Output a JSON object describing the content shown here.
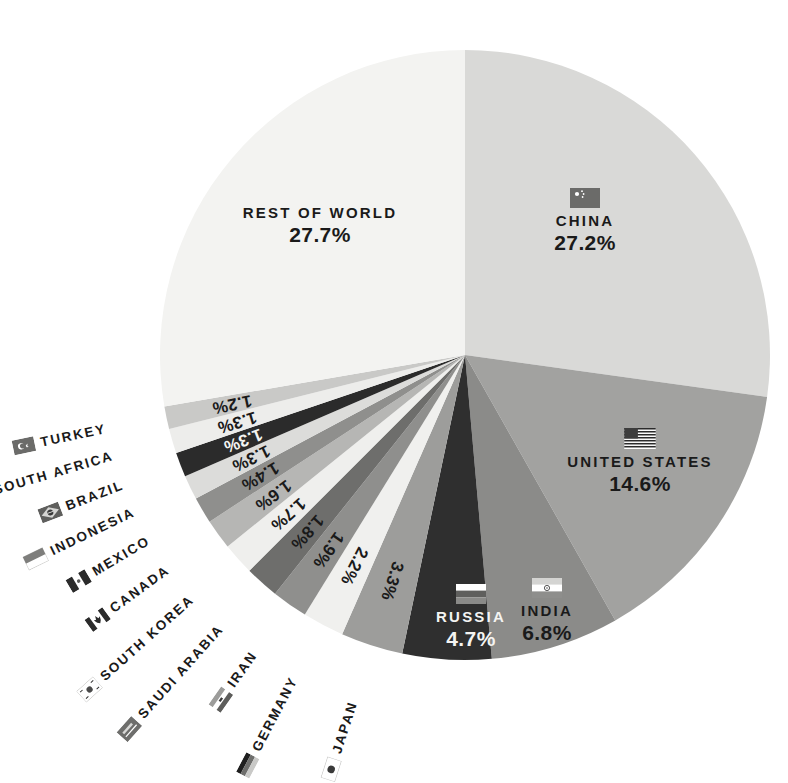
{
  "chart_data": {
    "type": "pie",
    "title": "",
    "subtitle": "",
    "xlabel": "",
    "ylabel": "",
    "legend_position": "on-slice",
    "grid": false,
    "unit": "%",
    "total": 100,
    "categories": [
      "China",
      "United States",
      "India",
      "Russia",
      "Japan",
      "Germany",
      "Iran",
      "Saudi Arabia",
      "South Korea",
      "Canada",
      "Mexico",
      "Indonesia",
      "Brazil",
      "South Africa",
      "Turkey",
      "Rest of World"
    ],
    "values": [
      27.2,
      14.6,
      6.8,
      4.7,
      3.3,
      2.2,
      1.9,
      1.8,
      1.7,
      1.6,
      1.4,
      1.3,
      1.3,
      1.3,
      1.2,
      27.7
    ],
    "slices": [
      {
        "name": "CHINA",
        "value": 27.2,
        "label": "27.2%",
        "color": "#d9d9d7",
        "label_placement": "inside",
        "flag": "flag-china",
        "text_color": "#1a1a1a"
      },
      {
        "name": "UNITED STATES",
        "value": 14.6,
        "label": "14.6%",
        "color": "#a2a2a0",
        "label_placement": "inside",
        "flag": "flag-united-states",
        "text_color": "#1a1a1a"
      },
      {
        "name": "INDIA",
        "value": 6.8,
        "label": "6.8%",
        "color": "#8b8b89",
        "label_placement": "inside",
        "flag": "flag-india",
        "text_color": "#1a1a1a"
      },
      {
        "name": "RUSSIA",
        "value": 4.7,
        "label": "4.7%",
        "color": "#2f2f2f",
        "label_placement": "inside",
        "flag": "flag-russia",
        "text_color": "#f4f4f2"
      },
      {
        "name": "JAPAN",
        "value": 3.3,
        "label": "3.3%",
        "color": "#9d9d9b",
        "label_placement": "outside",
        "flag": "flag-japan",
        "text_color": "#1a1a1a"
      },
      {
        "name": "GERMANY",
        "value": 2.2,
        "label": "2.2%",
        "color": "#f0f0ee",
        "label_placement": "outside",
        "flag": "flag-germany",
        "text_color": "#1a1a1a"
      },
      {
        "name": "IRAN",
        "value": 1.9,
        "label": "1.9%",
        "color": "#8f8f8d",
        "label_placement": "outside",
        "flag": "flag-iran",
        "text_color": "#1a1a1a"
      },
      {
        "name": "SAUDI ARABIA",
        "value": 1.8,
        "label": "1.8%",
        "color": "#6e6e6c",
        "label_placement": "outside",
        "flag": "flag-saudi-arabia",
        "text_color": "#1a1a1a"
      },
      {
        "name": "SOUTH KOREA",
        "value": 1.7,
        "label": "1.7%",
        "color": "#efefed",
        "label_placement": "outside",
        "flag": "flag-south-korea",
        "text_color": "#1a1a1a"
      },
      {
        "name": "CANADA",
        "value": 1.6,
        "label": "1.6%",
        "color": "#b6b6b4",
        "label_placement": "outside",
        "flag": "flag-canada",
        "text_color": "#1a1a1a"
      },
      {
        "name": "MEXICO",
        "value": 1.4,
        "label": "1.4%",
        "color": "#8f8f8d",
        "label_placement": "outside",
        "flag": "flag-mexico",
        "text_color": "#1a1a1a"
      },
      {
        "name": "INDONESIA",
        "value": 1.3,
        "label": "1.3%",
        "color": "#dcdcda",
        "label_placement": "outside",
        "flag": "flag-indonesia",
        "text_color": "#1a1a1a"
      },
      {
        "name": "BRAZIL",
        "value": 1.3,
        "label": "1.3%",
        "color": "#2b2b2b",
        "label_placement": "outside",
        "flag": "flag-brazil",
        "text_color": "#f4f4f2"
      },
      {
        "name": "SOUTH AFRICA",
        "value": 1.3,
        "label": "1.3%",
        "color": "#ededeb",
        "label_placement": "outside",
        "flag": "flag-south-africa",
        "text_color": "#1a1a1a"
      },
      {
        "name": "TURKEY",
        "value": 1.2,
        "label": "1.2%",
        "color": "#c9c9c7",
        "label_placement": "outside",
        "flag": "flag-turkey",
        "text_color": "#1a1a1a"
      },
      {
        "name": "REST OF WORLD",
        "value": 27.7,
        "label": "27.7%",
        "color": "#f3f3f1",
        "label_placement": "inside",
        "flag": null,
        "text_color": "#1a1a1a"
      }
    ]
  },
  "inside_labels": [
    {
      "name": "CHINA",
      "percent": "27.2%"
    },
    {
      "name": "UNITED STATES",
      "percent": "14.6%"
    },
    {
      "name": "INDIA",
      "percent": "6.8%"
    },
    {
      "name": "RUSSIA",
      "percent": "4.7%"
    },
    {
      "name": "REST OF WORLD",
      "percent": "27.7%"
    }
  ],
  "outside_labels": [
    {
      "name": "JAPAN",
      "percent": "3.3%"
    },
    {
      "name": "GERMANY",
      "percent": "2.2%"
    },
    {
      "name": "IRAN",
      "percent": "1.9%"
    },
    {
      "name": "SAUDI ARABIA",
      "percent": "1.8%"
    },
    {
      "name": "SOUTH KOREA",
      "percent": "1.7%"
    },
    {
      "name": "CANADA",
      "percent": "1.6%"
    },
    {
      "name": "MEXICO",
      "percent": "1.4%"
    },
    {
      "name": "INDONESIA",
      "percent": "1.3%"
    },
    {
      "name": "BRAZIL",
      "percent": "1.3%"
    },
    {
      "name": "SOUTH AFRICA",
      "percent": "1.3%"
    },
    {
      "name": "TURKEY",
      "percent": "1.2%"
    }
  ],
  "colors": {
    "background": "#ffffff",
    "text": "#1a1a1a",
    "text_light": "#f4f4f2"
  }
}
